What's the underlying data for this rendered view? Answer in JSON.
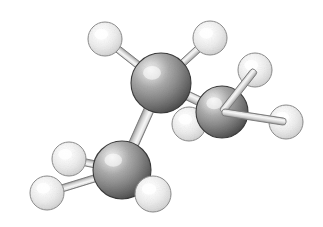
{
  "figure": {
    "name": "ball-and-stick-molecular-model",
    "kind": "3d-space-filling-ball-and-stick-diagram",
    "molecule_name": "propane",
    "formula": "C3H8",
    "background_color": "#ffffff",
    "width": 323,
    "height": 227,
    "render_style": "grayscale-dithered-shaded-spheres",
    "has_labels": false,
    "has_border": false,
    "visible_text": ""
  },
  "palette": {
    "background": "#ffffff",
    "carbon_light": "#e8e8e8",
    "carbon_mid": "#9a9a9a",
    "carbon_dark": "#555555",
    "carbon_edge": "#3a3a3a",
    "hydrogen_light": "#ffffff",
    "hydrogen_mid": "#f0f0f0",
    "hydrogen_dark": "#c8c8c8",
    "hydrogen_edge": "#8c8c8c",
    "bond_light": "#f2f2f2",
    "bond_mid": "#d0d0d0",
    "bond_dark": "#9c9c9c",
    "bond_edge": "#7a7a7a"
  },
  "atoms": [
    {
      "id": "C1",
      "element": "C",
      "label": "carbon-top-left",
      "cx": 161,
      "cy": 83,
      "r": 30,
      "z": 3
    },
    {
      "id": "C2",
      "element": "C",
      "label": "carbon-right",
      "cx": 222,
      "cy": 112,
      "r": 26,
      "z": 4
    },
    {
      "id": "C3",
      "element": "C",
      "label": "carbon-bottom-left",
      "cx": 122,
      "cy": 170,
      "r": 29,
      "z": 3
    },
    {
      "id": "H1",
      "element": "H",
      "label": "hydrogen-top-left",
      "cx": 105,
      "cy": 39,
      "r": 17,
      "z": 2
    },
    {
      "id": "H2",
      "element": "H",
      "label": "hydrogen-top-right",
      "cx": 210,
      "cy": 38,
      "r": 17,
      "z": 2
    },
    {
      "id": "H3",
      "element": "H",
      "label": "hydrogen-upper-right",
      "cx": 255,
      "cy": 70,
      "r": 17,
      "z": 2
    },
    {
      "id": "H4",
      "element": "H",
      "label": "hydrogen-far-right",
      "cx": 286,
      "cy": 122,
      "r": 17,
      "z": 5
    },
    {
      "id": "H5",
      "element": "H",
      "label": "hydrogen-center-behind",
      "cx": 189,
      "cy": 124,
      "r": 17,
      "z": 1
    },
    {
      "id": "H6",
      "element": "H",
      "label": "hydrogen-mid-left",
      "cx": 69,
      "cy": 159,
      "r": 17,
      "z": 2
    },
    {
      "id": "H7",
      "element": "H",
      "label": "hydrogen-lower-left",
      "cx": 47,
      "cy": 193,
      "r": 17,
      "z": 2
    },
    {
      "id": "H8",
      "element": "H",
      "label": "hydrogen-bottom",
      "cx": 153,
      "cy": 194,
      "r": 18,
      "z": 5
    }
  ],
  "bonds": [
    {
      "id": "B-C1-C2",
      "from": "C1",
      "to": "C2",
      "label": "bond-carbon1-carbon2",
      "w": 9,
      "z": 2
    },
    {
      "id": "B-C1-C3",
      "from": "C1",
      "to": "C3",
      "label": "bond-carbon1-carbon3",
      "w": 10,
      "z": 2
    },
    {
      "id": "B-C1-H1",
      "from": "C1",
      "to": "H1",
      "label": "bond-carbon1-hydrogen-top-left",
      "w": 7,
      "z": 1
    },
    {
      "id": "B-C1-H2",
      "from": "C1",
      "to": "H2",
      "label": "bond-carbon1-hydrogen-top-right",
      "w": 7,
      "z": 1
    },
    {
      "id": "B-C2-H3",
      "from": "C2",
      "to": "H3",
      "label": "bond-carbon2-hydrogen-upper-right",
      "w": 7,
      "z": 6
    },
    {
      "id": "B-C2-H4",
      "from": "C2",
      "to": "H4",
      "label": "bond-carbon2-hydrogen-far-right",
      "w": 7,
      "z": 6
    },
    {
      "id": "B-C2-H5",
      "from": "C2",
      "to": "H5",
      "label": "bond-carbon2-hydrogen-center",
      "w": 6,
      "z": 1
    },
    {
      "id": "B-C3-H6",
      "from": "C3",
      "to": "H6",
      "label": "bond-carbon3-hydrogen-mid-left",
      "w": 7,
      "z": 1
    },
    {
      "id": "B-C3-H7",
      "from": "C3",
      "to": "H7",
      "label": "bond-carbon3-hydrogen-lower-left",
      "w": 7,
      "z": 1
    },
    {
      "id": "B-C3-H8",
      "from": "C3",
      "to": "H8",
      "label": "bond-carbon3-hydrogen-bottom",
      "w": 7,
      "z": 1
    }
  ],
  "geometry_notes": {
    "light_source": "upper-left",
    "highlight_offset_fraction": 0.33,
    "carbon_radius_px": [
      26,
      30
    ],
    "hydrogen_radius_px": [
      17,
      18
    ]
  }
}
